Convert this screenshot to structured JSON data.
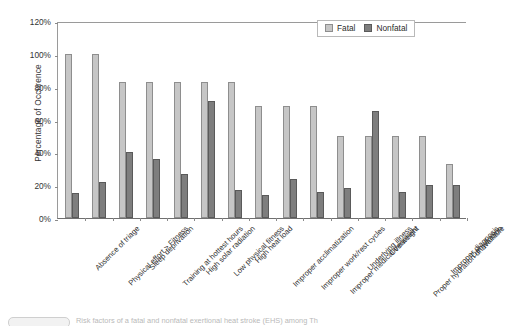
{
  "chart_data": {
    "type": "bar",
    "title": "",
    "xlabel": "",
    "ylabel": "Percentage of Occurence",
    "ylim": [
      0,
      120
    ],
    "ytick_labels": [
      "0%",
      "20%",
      "40%",
      "60%",
      "80%",
      "100%",
      "120%"
    ],
    "ytick_values": [
      0,
      20,
      40,
      60,
      80,
      100,
      120
    ],
    "grid": false,
    "legend_position": "top-right",
    "categories": [
      "Absence of triage",
      "Physical effort > Fitness",
      "Sleep deprivation",
      "Training at hottest hours",
      "High solar radiation",
      "Low physical fitness",
      "High heat load",
      "Improper acclimatization",
      "Improper work/rest cycles",
      "Improper medical treatment",
      "Underlying illness",
      "Overweight",
      "Proper hydration unavailable",
      "Improper diagnosis",
      "Dehydration"
    ],
    "series": [
      {
        "name": "Fatal",
        "color": "#c6c6c6",
        "values": [
          100,
          100,
          83,
          83,
          83,
          83,
          83,
          68,
          68,
          68,
          50,
          50,
          50,
          50,
          33
        ]
      },
      {
        "name": "Nonfatal",
        "color": "#7e7e7e",
        "values": [
          15,
          22,
          40,
          36,
          27,
          71,
          17,
          14,
          24,
          16,
          18,
          65,
          16,
          20,
          20
        ]
      }
    ]
  },
  "legend": {
    "items": [
      {
        "label": "Fatal",
        "swatch": "fatal"
      },
      {
        "label": "Nonfatal",
        "swatch": "nonfatal"
      }
    ]
  },
  "caption": {
    "text": "Risk factors of a fatal and nonfatal exertional heat stroke (EHS) among Th"
  }
}
